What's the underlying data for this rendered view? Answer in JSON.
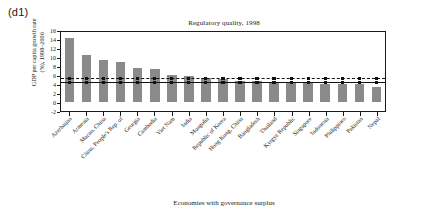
{
  "panel_label": "(d1)",
  "chart_data": {
    "type": "bar",
    "title": "Regulatory quality, 1998",
    "xlabel": "Economies with governance surplus",
    "ylabel": "GDP per capita growth rate (%), 1998–2006",
    "ylabel_line1": "GDP per capita growth rate",
    "ylabel_line2": "(%), 1998–2006",
    "ylim": [
      -2,
      16
    ],
    "yticks": [
      16,
      14,
      12,
      10,
      8,
      6,
      4,
      2,
      0,
      -2
    ],
    "grid": false,
    "legend": "none",
    "bar_color": "#8a8a8a",
    "categories": [
      "Azerbaijan",
      "Armenia",
      "Macao, China",
      "China, People's Rep. of",
      "Georgia",
      "Cambodia",
      "Viet Nam",
      "India",
      "Mongolia",
      "Republic of Korea",
      "Hong Kong, China",
      "Bangladesh",
      "Thailand",
      "Kyrgyz Republic",
      "Singapore",
      "Indonesia",
      "Philippines",
      "Pakistan",
      "Nepal"
    ],
    "values": [
      14.2,
      10.4,
      9.3,
      9.0,
      7.5,
      7.3,
      6.0,
      5.8,
      5.3,
      5.2,
      4.6,
      4.6,
      4.4,
      4.4,
      4.3,
      4.1,
      4.0,
      3.9,
      3.3
    ],
    "series": [
      {
        "name": "GDP per capita growth rate",
        "type": "bar",
        "values": [
          14.2,
          10.4,
          9.3,
          9.0,
          7.5,
          7.3,
          6.0,
          5.8,
          5.3,
          5.2,
          4.6,
          4.6,
          4.4,
          4.4,
          4.3,
          4.1,
          4.0,
          3.9,
          3.3
        ]
      },
      {
        "name": "reference line (solid)",
        "type": "line",
        "style": "solid",
        "value": 5.0
      },
      {
        "name": "reference line (dashed)",
        "type": "line",
        "style": "dashed",
        "value": 5.8
      }
    ]
  }
}
